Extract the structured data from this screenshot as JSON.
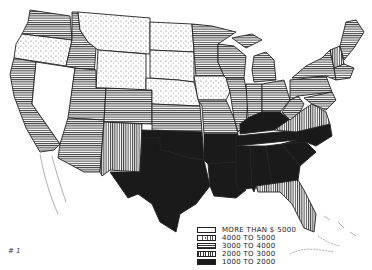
{
  "map": {
    "title": "Per capita income by state",
    "figure_label": "# 1",
    "colors": {
      "ink": "#1a1a1a",
      "paper": "#ffffff"
    }
  },
  "legend": {
    "items": [
      {
        "label": "MORE THAN $ 5000",
        "pattern": "blank"
      },
      {
        "label": "4000 TO 5000",
        "pattern": "stipple"
      },
      {
        "label": "3000 TO 4000",
        "pattern": "horizontal-hatch"
      },
      {
        "label": "2000 TO 3000",
        "pattern": "vertical-hatch"
      },
      {
        "label": "1000 TO 2000",
        "pattern": "solid-black"
      }
    ]
  },
  "regions": {
    "stipple": [
      "Oregon",
      "Montana",
      "Wyoming",
      "North Dakota",
      "South Dakota",
      "Nebraska",
      "Kansas",
      "Iowa"
    ],
    "horizontal-hatch": [
      "Washington",
      "Idaho",
      "California",
      "Utah",
      "Colorado",
      "Arizona",
      "Minnesota",
      "Wisconsin",
      "Michigan",
      "Missouri",
      "Illinois",
      "Indiana",
      "Ohio",
      "Pennsylvania",
      "New York",
      "Maine",
      "West Virginia"
    ],
    "vertical-hatch": [
      "New Mexico",
      "Florida",
      "Virginia",
      "Vermont",
      "New Hampshire"
    ],
    "solid-black": [
      "Texas",
      "Oklahoma",
      "Arkansas",
      "Louisiana",
      "Mississippi",
      "Alabama",
      "Georgia",
      "Tennessee",
      "Kentucky",
      "South Carolina",
      "North Carolina"
    ],
    "blank": [
      "Nevada"
    ]
  }
}
